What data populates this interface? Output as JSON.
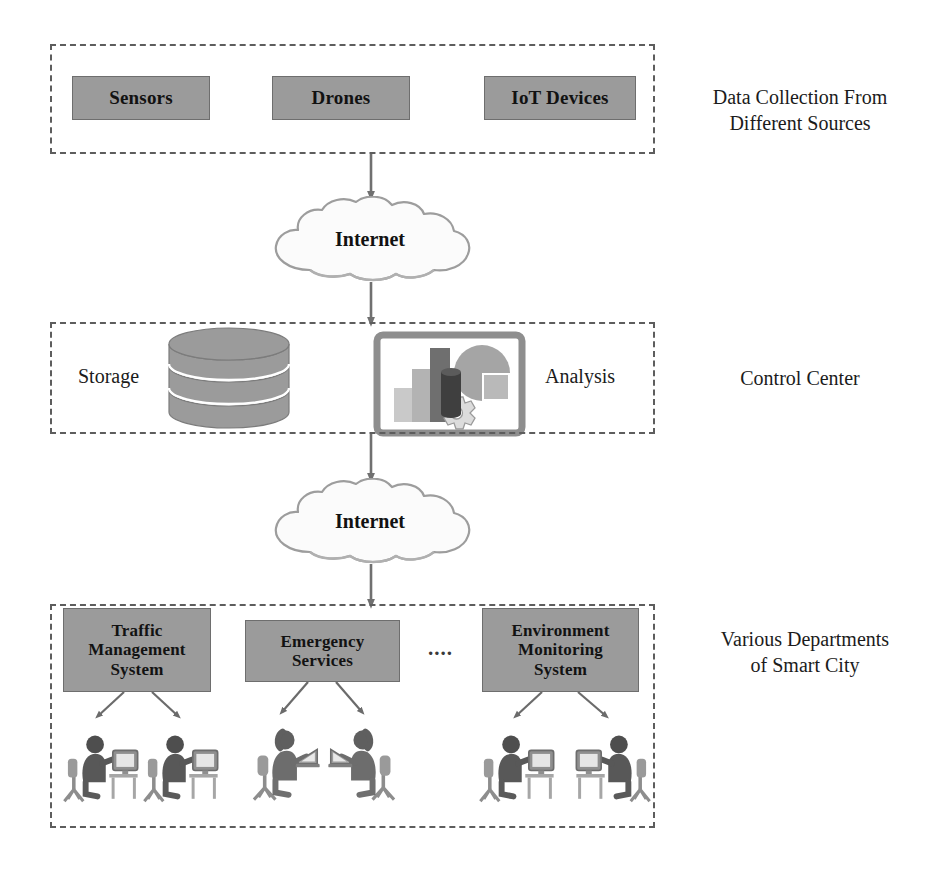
{
  "diagram": {
    "palette": {
      "box_fill": "#9b9b9b",
      "box_stroke": "#6e6e6e",
      "dashed_border": "#5d5d5d",
      "arrow": "#707070",
      "text": "#1a1a1a",
      "cloud_fill": "#fbfbfb",
      "cloud_stroke": "#9d9d9d",
      "bar_light": "#c9c9c9",
      "bar_mid": "#a8a8a8",
      "bar_dark": "#6f6f6f",
      "pie_fill": "#a5a5a5",
      "cylinder_dark": "#4a4a4a",
      "gear_fill": "#dcdcdc"
    },
    "tiers": [
      {
        "id": "sources",
        "side_label": "Data Collection From\nDifferent Sources",
        "nodes": [
          {
            "id": "sensors",
            "label": "Sensors"
          },
          {
            "id": "drones",
            "label": "Drones"
          },
          {
            "id": "iot",
            "label": "IoT Devices"
          }
        ]
      },
      {
        "id": "control",
        "side_label": "Control Center",
        "nodes": [
          {
            "id": "storage",
            "label": "Storage",
            "icon": "database-cylinder-icon"
          },
          {
            "id": "analysis",
            "label": "Analysis",
            "icon": "analytics-screen-icon"
          }
        ]
      },
      {
        "id": "departments",
        "side_label": "Various Departments\nof Smart City",
        "ellipsis": "....",
        "nodes": [
          {
            "id": "traffic",
            "label": "Traffic\nManagement\nSystem",
            "operators": 2
          },
          {
            "id": "emergency",
            "label": "Emergency\nServices",
            "operators": 2
          },
          {
            "id": "environment",
            "label": "Environment\nMonitoring\nSystem",
            "operators": 2
          }
        ]
      }
    ],
    "clouds": [
      {
        "id": "cloud-top",
        "label": "Internet"
      },
      {
        "id": "cloud-bottom",
        "label": "Internet"
      }
    ],
    "connections": [
      {
        "from": "sources",
        "to": "cloud-top",
        "style": "arrow-down"
      },
      {
        "from": "cloud-top",
        "to": "control",
        "style": "arrow-down"
      },
      {
        "from": "control",
        "to": "cloud-bottom",
        "style": "arrow-down"
      },
      {
        "from": "cloud-bottom",
        "to": "departments",
        "style": "arrow-down"
      },
      {
        "from": "traffic",
        "to": "operators",
        "style": "branch-arrows"
      },
      {
        "from": "emergency",
        "to": "operators",
        "style": "branch-arrows"
      },
      {
        "from": "environment",
        "to": "operators",
        "style": "branch-arrows"
      }
    ]
  }
}
